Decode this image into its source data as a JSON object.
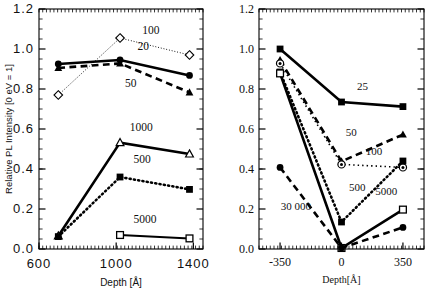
{
  "figure": {
    "title": "",
    "background": "#ffffff",
    "ink": "#000000"
  },
  "chart_data": [
    {
      "id": "left-panel",
      "type": "line",
      "title": "",
      "xlabel": "Depth  [Å]",
      "ylabel": "Relative PL Intensity [0 eV = 1]",
      "xlim": [
        600,
        1450
      ],
      "ylim": [
        0.0,
        1.2
      ],
      "xticks": [
        600,
        1000,
        1400
      ],
      "xticklabels": [
        "600",
        "1000",
        "1400"
      ],
      "yticks": [
        0.0,
        0.2,
        0.4,
        0.6,
        0.8,
        1.0,
        1.2
      ],
      "yticklabels": [
        "0.0",
        "0.2",
        "0.4",
        "0.6",
        "0.8",
        "1.0",
        "1.2"
      ],
      "grid": false,
      "legend_position": "inline-annotations",
      "x": [
        700,
        1020,
        1380
      ],
      "series": [
        {
          "name": "100",
          "label": "100",
          "marker": "open-diamond",
          "linestyle": "dotted",
          "linewidth": 1,
          "values": [
            0.77,
            1.055,
            0.97
          ]
        },
        {
          "name": "20",
          "label": "20",
          "marker": "filled-circle",
          "linestyle": "solid",
          "linewidth": 2.6,
          "values": [
            0.925,
            0.945,
            0.868
          ]
        },
        {
          "name": "50",
          "label": "50",
          "marker": "filled-triangle",
          "linestyle": "dashed",
          "linewidth": 2.6,
          "values": [
            0.905,
            0.928,
            0.783
          ]
        },
        {
          "name": "1000",
          "label": "1000",
          "marker": "open-triangle",
          "linestyle": "solid",
          "linewidth": 2.6,
          "values": [
            0.065,
            0.532,
            0.475
          ]
        },
        {
          "name": "500",
          "label": "500",
          "marker": "filled-square",
          "linestyle": "dotted-thick",
          "linewidth": 2.6,
          "values": [
            0.062,
            0.36,
            0.298
          ]
        },
        {
          "name": "5000",
          "label": "5000",
          "marker": "open-square",
          "linestyle": "solid",
          "linewidth": 2.0,
          "values": [
            null,
            0.07,
            0.053
          ]
        }
      ],
      "annotations": [
        {
          "text": "100",
          "x": 1180,
          "y": 1.075
        },
        {
          "text": "20",
          "x": 1140,
          "y": 0.995
        },
        {
          "text": "50",
          "x": 1075,
          "y": 0.812
        },
        {
          "text": "1000",
          "x": 1130,
          "y": 0.592
        },
        {
          "text": "500",
          "x": 1135,
          "y": 0.43
        },
        {
          "text": "5000",
          "x": 1150,
          "y": 0.128
        }
      ]
    },
    {
      "id": "right-panel",
      "type": "line",
      "title": "",
      "xlabel": "Depth[Å]",
      "ylabel": "",
      "xlim": [
        -470,
        470
      ],
      "ylim": [
        0.0,
        1.2
      ],
      "xticks": [
        -350,
        0,
        350
      ],
      "xticklabels": [
        "-350",
        "0",
        "350"
      ],
      "yticks": [
        0.0,
        0.2,
        0.4,
        0.6,
        0.8,
        1.0,
        1.2
      ],
      "yticklabels": [
        "0.0",
        "0.2",
        "0.4",
        "0.6",
        "0.8",
        "1.0",
        "1.2"
      ],
      "grid": false,
      "legend_position": "inline-annotations",
      "x": [
        -350,
        0,
        350
      ],
      "series": [
        {
          "name": "25",
          "label": "25",
          "marker": "filled-square",
          "linestyle": "solid",
          "linewidth": 2.6,
          "values": [
            1.0,
            0.735,
            0.712
          ]
        },
        {
          "name": "50",
          "label": "50",
          "marker": "filled-triangle",
          "linestyle": "dashed",
          "linewidth": 2.6,
          "values": [
            0.945,
            0.438,
            0.572
          ]
        },
        {
          "name": "100",
          "label": "100",
          "marker": "circled-dot",
          "linestyle": "dotted",
          "linewidth": 1.6,
          "values": [
            0.928,
            0.423,
            0.408
          ]
        },
        {
          "name": "500",
          "label": "500",
          "marker": "filled-square",
          "linestyle": "dotted-thick",
          "linewidth": 2.6,
          "values": [
            0.885,
            0.135,
            0.44
          ]
        },
        {
          "name": "5000",
          "label": "5000",
          "marker": "open-square",
          "linestyle": "solid",
          "linewidth": 2.6,
          "values": [
            0.878,
            0.005,
            0.197
          ]
        },
        {
          "name": "30 000",
          "label": "30 000",
          "marker": "filled-circle",
          "linestyle": "dashed",
          "linewidth": 2.6,
          "values": [
            0.408,
            0.005,
            0.108
          ]
        }
      ],
      "annotations": [
        {
          "text": "25",
          "x": 120,
          "y": 0.795
        },
        {
          "text": "50",
          "x": 55,
          "y": 0.565
        },
        {
          "text": "100",
          "x": 185,
          "y": 0.468
        },
        {
          "text": "500",
          "x": 90,
          "y": 0.292
        },
        {
          "text": "5000",
          "x": 255,
          "y": 0.272
        },
        {
          "text": "30 000",
          "x": -260,
          "y": 0.193
        }
      ]
    }
  ]
}
